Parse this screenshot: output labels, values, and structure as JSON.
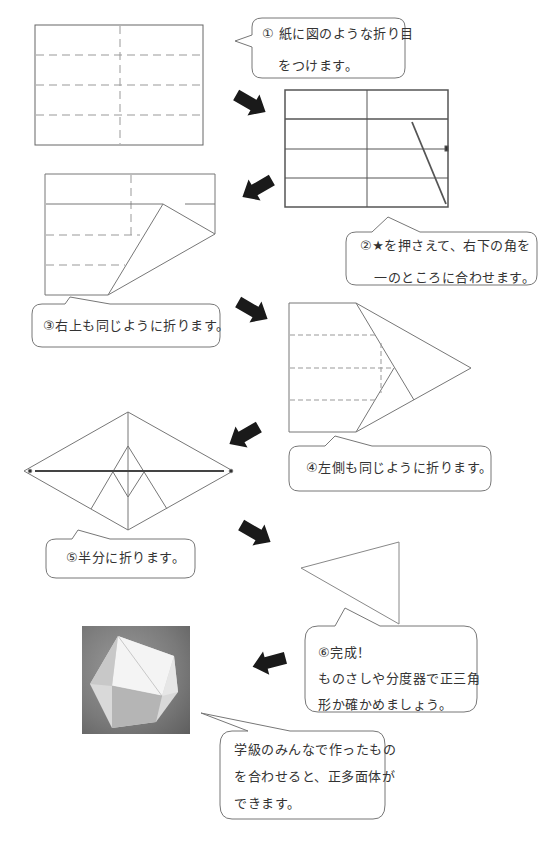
{
  "steps": [
    {
      "id": 1,
      "lines": [
        "① 紙に図のような折り目",
        "をつけます。"
      ]
    },
    {
      "id": 2,
      "lines": [
        "②★を押さえて、右下の角を",
        "一のところに合わせます。"
      ]
    },
    {
      "id": 3,
      "lines": [
        "③右上も同じように折ります。"
      ]
    },
    {
      "id": 4,
      "lines": [
        "④左側も同じように折ります。"
      ]
    },
    {
      "id": 5,
      "lines": [
        "⑤半分に折ります。"
      ]
    },
    {
      "id": 6,
      "lines": [
        "⑥完成！",
        "ものさしや分度器で正三角",
        "形か確かめましょう。"
      ]
    }
  ],
  "closing_note": {
    "lines": [
      "学級のみんなで作ったもの",
      "を合わせると、正多面体が",
      "できます。"
    ]
  },
  "photo": {
    "subject": "icosahedron-photo"
  },
  "colors": {
    "line": "#555555",
    "dash": "#888888",
    "arrow": "#1a1a1a",
    "bubble_border": "#777777"
  }
}
